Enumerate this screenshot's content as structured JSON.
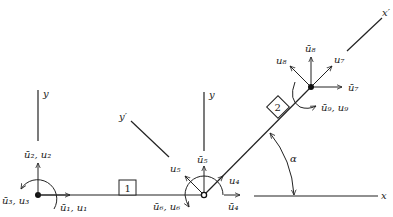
{
  "diagram": {
    "type": "frame-element-coordinate-systems",
    "axes": {
      "global_y_left": "y",
      "global_y_mid": "y",
      "local_y": "y′",
      "local_x": "x′",
      "global_x": "x"
    },
    "angle_label": "α",
    "elements": [
      {
        "id": "1",
        "label": "1"
      },
      {
        "id": "2",
        "label": "2"
      }
    ],
    "nodes": [
      {
        "name": "node-1",
        "labels": {
          "u2": "ū₂, u₂",
          "u1": "ū₁, u₁",
          "u3": "ū₃, u₃"
        }
      },
      {
        "name": "node-2",
        "labels": {
          "u5bar": "ū₅",
          "u5": "u₅",
          "u4": "u₄",
          "u4bar": "ū₄",
          "u6": "ū₆, u₆"
        }
      },
      {
        "name": "node-3",
        "labels": {
          "u8bar": "ū₈",
          "u8": "u₈",
          "u7": "u₇",
          "u7bar": "ū₇",
          "u9": "ū₉, u₉"
        }
      }
    ]
  }
}
